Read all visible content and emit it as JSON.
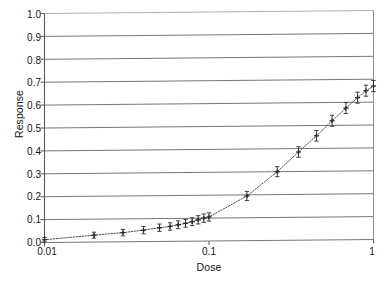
{
  "chart_data": {
    "type": "scatter",
    "title": "",
    "subtitle": "",
    "xlabel": "Dose",
    "ylabel": "Response",
    "xscale": "log",
    "yscale": "linear",
    "xlim": [
      0.01,
      1
    ],
    "ylim": [
      0.0,
      1.0
    ],
    "grid": true,
    "grid_axis": "y",
    "legend": "none",
    "xticks": [
      0.01,
      0.1,
      1
    ],
    "xtick_labels": [
      "0.01",
      "0.1",
      "1"
    ],
    "yticks": [
      0.0,
      0.1,
      0.2,
      0.3,
      0.4,
      0.5,
      0.6,
      0.7,
      0.8,
      0.9,
      1.0
    ],
    "ytick_labels": [
      "0.0",
      "0.1",
      "0.2",
      "0.3",
      "0.4",
      "0.5",
      "0.6",
      "0.7",
      "0.8",
      "0.9",
      "1.0"
    ],
    "series": [
      {
        "name": "dose-response",
        "marker": "plus-with-errorbars",
        "line": "dotted-fit-curve",
        "points": [
          {
            "x": 0.01,
            "y": 0.012,
            "yerr": 0.01
          },
          {
            "x": 0.02,
            "y": 0.03,
            "yerr": 0.013
          },
          {
            "x": 0.03,
            "y": 0.04,
            "yerr": 0.014
          },
          {
            "x": 0.04,
            "y": 0.05,
            "yerr": 0.016
          },
          {
            "x": 0.05,
            "y": 0.06,
            "yerr": 0.016
          },
          {
            "x": 0.058,
            "y": 0.065,
            "yerr": 0.016
          },
          {
            "x": 0.065,
            "y": 0.072,
            "yerr": 0.017
          },
          {
            "x": 0.072,
            "y": 0.078,
            "yerr": 0.017
          },
          {
            "x": 0.079,
            "y": 0.085,
            "yerr": 0.017
          },
          {
            "x": 0.086,
            "y": 0.093,
            "yerr": 0.018
          },
          {
            "x": 0.093,
            "y": 0.1,
            "yerr": 0.018
          },
          {
            "x": 0.1,
            "y": 0.105,
            "yerr": 0.018
          },
          {
            "x": 0.17,
            "y": 0.195,
            "yerr": 0.02
          },
          {
            "x": 0.26,
            "y": 0.3,
            "yerr": 0.022
          },
          {
            "x": 0.35,
            "y": 0.385,
            "yerr": 0.023
          },
          {
            "x": 0.45,
            "y": 0.455,
            "yerr": 0.023
          },
          {
            "x": 0.56,
            "y": 0.52,
            "yerr": 0.024
          },
          {
            "x": 0.68,
            "y": 0.575,
            "yerr": 0.024
          },
          {
            "x": 0.8,
            "y": 0.62,
            "yerr": 0.024
          },
          {
            "x": 0.9,
            "y": 0.65,
            "yerr": 0.024
          },
          {
            "x": 1.0,
            "y": 0.67,
            "yerr": 0.024
          }
        ]
      }
    ],
    "colors": {
      "axis": "#555555",
      "grid": "#666666",
      "marker": "#2b2b2b",
      "fit_line": "#4a4a4a",
      "background": "#ffffff"
    }
  }
}
